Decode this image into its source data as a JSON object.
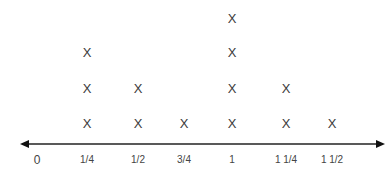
{
  "chart_data": {
    "type": "scatter",
    "subtype": "line-plot (X marks)",
    "title": "",
    "xlabel": "",
    "ylabel": "",
    "categories": [
      "0",
      "1/4",
      "1/2",
      "3/4",
      "1",
      "1 1/4",
      "1 1/2"
    ],
    "x": [
      0,
      0.25,
      0.5,
      0.75,
      1,
      1.25,
      1.5
    ],
    "values": [
      0,
      3,
      2,
      1,
      4,
      2,
      1
    ],
    "marker": "X",
    "xlim": [
      0,
      1.5
    ],
    "grid": false,
    "legend": null,
    "axis": "number line with arrows on both ends"
  },
  "layout": {
    "tick_x": [
      37,
      87,
      138,
      184,
      232,
      286,
      332
    ],
    "row_y": [
      123,
      88,
      52,
      18
    ],
    "axis_y": 144,
    "line_color": "#222222"
  }
}
